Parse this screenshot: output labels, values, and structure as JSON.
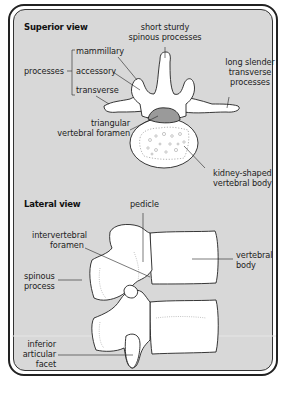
{
  "superior_view": {
    "heading": "Superior view",
    "labels": {
      "processes": "processes",
      "mammillary": "mammillary",
      "accessory": "accessory",
      "transverse": "transverse",
      "spinous_line1": "short sturdy",
      "spinous_line2": "spinous processes",
      "transverse_long_line1": "long slender",
      "transverse_long_line2": "transverse",
      "transverse_long_line3": "processes",
      "foramen_line1": "triangular",
      "foramen_line2": "vertebral foramen",
      "body_line1": "kidney-shaped",
      "body_line2": "vertebral body"
    }
  },
  "lateral_view": {
    "heading": "Lateral view",
    "labels": {
      "pedicle": "pedicle",
      "iv_foramen_line1": "intervertebral",
      "iv_foramen_line2": "foramen",
      "vertebral_body_line1": "vertebral",
      "vertebral_body_line2": "body",
      "spinous_line1": "spinous",
      "spinous_line2": "process",
      "facet_line1": "inferior",
      "facet_line2": "articular",
      "facet_line3": "facet"
    }
  },
  "colors": {
    "panel_background": "#d8d8d8",
    "bone_fill": "#ffffff",
    "foramen_fill": "#9a9a9a",
    "outline": "#222222"
  }
}
